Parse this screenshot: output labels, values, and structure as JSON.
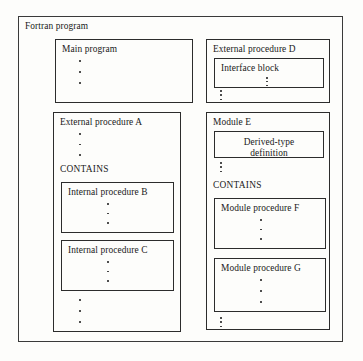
{
  "diagram": {
    "title": "Fortran program",
    "ellipsis_glyph": "vertical-ellipsis",
    "stroke_color": "#2c2c2c",
    "background_color": "#fdfdfb",
    "text_color": "#1a1a1a",
    "left_column": {
      "main_program": {
        "label": "Main program"
      },
      "external_procedure_a": {
        "label": "External procedure A",
        "contains_keyword": "CONTAINS",
        "internal_procedure_b": {
          "label": "Internal procedure B"
        },
        "internal_procedure_c": {
          "label": "Internal procedure C"
        }
      }
    },
    "right_column": {
      "external_procedure_d": {
        "label": "External procedure D",
        "interface_block": {
          "label": "Interface block"
        }
      },
      "module_e": {
        "label": "Module E",
        "derived_type_definition": {
          "line1": "Derived-type",
          "line2": "definition"
        },
        "contains_keyword": "CONTAINS",
        "module_procedure_f": {
          "label": "Module procedure F"
        },
        "module_procedure_g": {
          "label": "Module procedure G"
        }
      }
    }
  }
}
